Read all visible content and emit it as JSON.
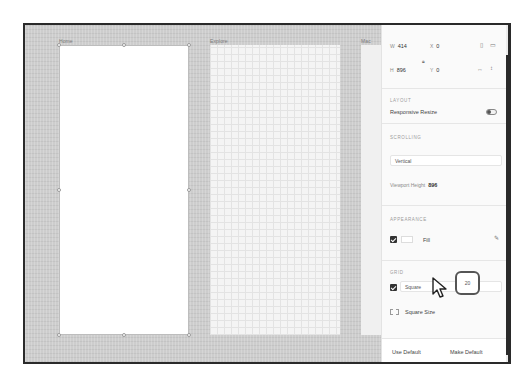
{
  "canvas": {
    "artboards": [
      {
        "label": "Home"
      },
      {
        "label": "Explore"
      },
      {
        "label": "Mac Data"
      }
    ]
  },
  "panel": {
    "transform": {
      "w_label": "W",
      "w_value": "414",
      "h_label": "H",
      "h_value": "896",
      "x_label": "X",
      "x_value": "0",
      "y_label": "Y",
      "y_value": "0",
      "icons": [
        "portrait-icon",
        "landscape-icon",
        "flip-horizontal-icon",
        "flip-vertical-icon",
        "lock-aspect-icon"
      ]
    },
    "layout": {
      "title": "LAYOUT",
      "responsive_resize_label": "Responsive Resize",
      "responsive_resize_on": false
    },
    "scrolling": {
      "title": "SCROLLING",
      "mode_value": "Vertical",
      "viewport_height_label": "Viewport Height",
      "viewport_height_value": "896"
    },
    "appearance": {
      "title": "APPEARANCE",
      "fill_label": "Fill",
      "fill_checked": true,
      "fill_color": "#ffffff"
    },
    "grid": {
      "title": "GRID",
      "grid_checked": true,
      "grid_type_value": "Square",
      "square_size_label": "Square Size",
      "square_size_value": "20"
    },
    "footer": {
      "use_default_label": "Use Default",
      "make_default_label": "Make Default"
    }
  },
  "colors": {
    "canvas_bg": "#cdcdcd",
    "panel_bg": "#fafafa",
    "frame_border": "#2a2a2a",
    "highlight_border": "#555555"
  }
}
